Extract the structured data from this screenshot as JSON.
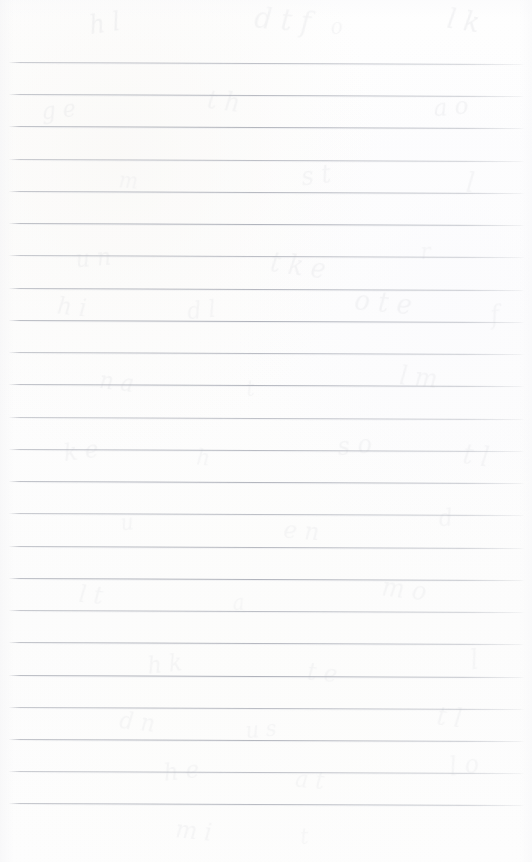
{
  "document": {
    "kind": "scanned-notebook-page",
    "title": "Blank ruled notebook page",
    "text_content": "",
    "handwriting": "",
    "page_width": 532,
    "page_height": 862,
    "paper_color": "#fdfdfd",
    "background_color": "#ffffff"
  },
  "ruling": {
    "style": "horizontal-ruled",
    "line_color": "#a8abb4",
    "line_count": 24,
    "line_thickness_px": 1,
    "first_line_y": 62,
    "line_spacing_px": 32.25,
    "last_line_y": 803,
    "line_start_x": 9,
    "line_end_x": 524,
    "slope_px": 2,
    "has_vertical_margin_rule": false,
    "has_holes": false,
    "top_margin_px": 62,
    "bottom_margin_px": 59,
    "lines_y": [
      62,
      94,
      126,
      159,
      191,
      223,
      255,
      288,
      320,
      352,
      384,
      417,
      449,
      481,
      513,
      546,
      578,
      610,
      642,
      675,
      707,
      739,
      771,
      803
    ]
  },
  "ghost_marks": {
    "description": "very faint bleed-through of handwriting from the reverse side of the sheet",
    "color": "#d9dade",
    "marks": [
      {
        "glyphs": "h l",
        "x": 88,
        "y": 8,
        "size": 26,
        "rotate": -8,
        "opacity": 0.3
      },
      {
        "glyphs": "d t f",
        "x": 252,
        "y": 2,
        "size": 30,
        "rotate": 5,
        "opacity": 0.26
      },
      {
        "glyphs": "o",
        "x": 330,
        "y": 14,
        "size": 22,
        "rotate": -4,
        "opacity": 0.22
      },
      {
        "glyphs": "l k",
        "x": 446,
        "y": 4,
        "size": 28,
        "rotate": 9,
        "opacity": 0.3
      },
      {
        "glyphs": "g e",
        "x": 40,
        "y": 96,
        "size": 24,
        "rotate": -6,
        "opacity": 0.26
      },
      {
        "glyphs": "t h",
        "x": 206,
        "y": 86,
        "size": 26,
        "rotate": 7,
        "opacity": 0.24
      },
      {
        "glyphs": "a o",
        "x": 432,
        "y": 92,
        "size": 25,
        "rotate": -5,
        "opacity": 0.26
      },
      {
        "glyphs": "m",
        "x": 118,
        "y": 168,
        "size": 22,
        "rotate": 4,
        "opacity": 0.2
      },
      {
        "glyphs": "s t",
        "x": 300,
        "y": 160,
        "size": 26,
        "rotate": -7,
        "opacity": 0.24
      },
      {
        "glyphs": "l",
        "x": 466,
        "y": 166,
        "size": 28,
        "rotate": 6,
        "opacity": 0.22
      },
      {
        "glyphs": "u n",
        "x": 74,
        "y": 244,
        "size": 24,
        "rotate": -5,
        "opacity": 0.24
      },
      {
        "glyphs": "t k e",
        "x": 268,
        "y": 250,
        "size": 27,
        "rotate": 8,
        "opacity": 0.26
      },
      {
        "glyphs": "r",
        "x": 420,
        "y": 238,
        "size": 23,
        "rotate": -3,
        "opacity": 0.2
      },
      {
        "glyphs": "h i",
        "x": 56,
        "y": 292,
        "size": 25,
        "rotate": 6,
        "opacity": 0.24
      },
      {
        "glyphs": "d l",
        "x": 186,
        "y": 296,
        "size": 24,
        "rotate": -6,
        "opacity": 0.22
      },
      {
        "glyphs": "o t e",
        "x": 352,
        "y": 286,
        "size": 28,
        "rotate": 5,
        "opacity": 0.26
      },
      {
        "glyphs": "f",
        "x": 490,
        "y": 300,
        "size": 26,
        "rotate": -8,
        "opacity": 0.22
      },
      {
        "glyphs": "n a",
        "x": 98,
        "y": 368,
        "size": 24,
        "rotate": 7,
        "opacity": 0.24
      },
      {
        "glyphs": "t",
        "x": 246,
        "y": 376,
        "size": 22,
        "rotate": -4,
        "opacity": 0.2
      },
      {
        "glyphs": "l m",
        "x": 398,
        "y": 362,
        "size": 26,
        "rotate": 6,
        "opacity": 0.24
      },
      {
        "glyphs": "k e",
        "x": 62,
        "y": 436,
        "size": 25,
        "rotate": -7,
        "opacity": 0.24
      },
      {
        "glyphs": "h",
        "x": 196,
        "y": 444,
        "size": 23,
        "rotate": 5,
        "opacity": 0.2
      },
      {
        "glyphs": "s o",
        "x": 336,
        "y": 430,
        "size": 26,
        "rotate": -5,
        "opacity": 0.24
      },
      {
        "glyphs": "t l",
        "x": 462,
        "y": 440,
        "size": 27,
        "rotate": 8,
        "opacity": 0.22
      },
      {
        "glyphs": "u",
        "x": 120,
        "y": 510,
        "size": 22,
        "rotate": -6,
        "opacity": 0.2
      },
      {
        "glyphs": "e n",
        "x": 282,
        "y": 516,
        "size": 25,
        "rotate": 4,
        "opacity": 0.22
      },
      {
        "glyphs": "d",
        "x": 438,
        "y": 504,
        "size": 24,
        "rotate": -7,
        "opacity": 0.2
      },
      {
        "glyphs": "l t",
        "x": 78,
        "y": 580,
        "size": 25,
        "rotate": 6,
        "opacity": 0.22
      },
      {
        "glyphs": "a",
        "x": 232,
        "y": 590,
        "size": 22,
        "rotate": -4,
        "opacity": 0.18
      },
      {
        "glyphs": "m o",
        "x": 380,
        "y": 574,
        "size": 26,
        "rotate": 7,
        "opacity": 0.22
      },
      {
        "glyphs": "h k",
        "x": 146,
        "y": 650,
        "size": 24,
        "rotate": -6,
        "opacity": 0.22
      },
      {
        "glyphs": "t e",
        "x": 306,
        "y": 658,
        "size": 25,
        "rotate": 5,
        "opacity": 0.22
      },
      {
        "glyphs": "l",
        "x": 470,
        "y": 644,
        "size": 27,
        "rotate": -8,
        "opacity": 0.2
      },
      {
        "glyphs": "d n",
        "x": 118,
        "y": 708,
        "size": 24,
        "rotate": 6,
        "opacity": 0.22
      },
      {
        "glyphs": "u s",
        "x": 244,
        "y": 716,
        "size": 23,
        "rotate": -5,
        "opacity": 0.2
      },
      {
        "glyphs": "t l",
        "x": 436,
        "y": 702,
        "size": 26,
        "rotate": 7,
        "opacity": 0.22
      },
      {
        "glyphs": "h e",
        "x": 162,
        "y": 756,
        "size": 25,
        "rotate": -6,
        "opacity": 0.22
      },
      {
        "glyphs": "a t",
        "x": 294,
        "y": 766,
        "size": 24,
        "rotate": 5,
        "opacity": 0.2
      },
      {
        "glyphs": "l o",
        "x": 448,
        "y": 750,
        "size": 26,
        "rotate": -7,
        "opacity": 0.2
      },
      {
        "glyphs": "m i",
        "x": 174,
        "y": 816,
        "size": 25,
        "rotate": 6,
        "opacity": 0.22
      },
      {
        "glyphs": "t",
        "x": 300,
        "y": 824,
        "size": 22,
        "rotate": -4,
        "opacity": 0.18
      }
    ]
  }
}
